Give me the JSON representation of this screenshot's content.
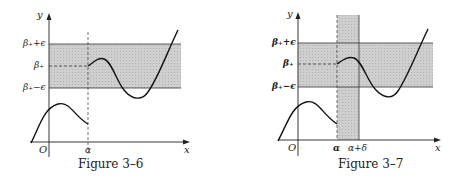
{
  "figures": [
    {
      "id": "fig-3-6",
      "caption": "Figure 3–6",
      "axis": {
        "x_label": "x",
        "y_label": "y",
        "origin_label": "O"
      },
      "band_labels": {
        "upper": "β₊+ϵ",
        "middle": "β₊",
        "lower": "β₊−ϵ"
      },
      "x_marks": [
        "α"
      ]
    },
    {
      "id": "fig-3-7",
      "caption": "Figure 3–7",
      "axis": {
        "x_label": "x",
        "y_label": "y",
        "origin_label": "O"
      },
      "band_labels": {
        "upper": "β₊+ϵ",
        "middle": "β₊",
        "lower": "β₊−ϵ"
      },
      "x_marks": [
        "α",
        "α+δ"
      ]
    }
  ],
  "colors": {
    "shade": "#c8c8c8",
    "ink": "#222222",
    "background": "#ffffff"
  }
}
